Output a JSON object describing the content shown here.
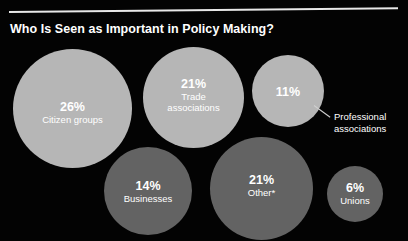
{
  "chart_data": {
    "type": "bubble",
    "title": "Who Is Seen as Important in Policy Making?",
    "xlabel": "",
    "ylabel": "",
    "units": "percent",
    "grid": false,
    "legend": "none",
    "colors": {
      "background": "#030303",
      "bubble_light": "#b6b6b6",
      "bubble_dark": "#636363",
      "text": "#ffffff",
      "rule": "#e8e8e8",
      "callout_line": "#cfcfcf"
    },
    "categories": [
      "Citizen groups",
      "Trade associations",
      "Professional associations",
      "Businesses",
      "Other*",
      "Unions"
    ],
    "values": [
      26,
      21,
      11,
      14,
      21,
      6
    ],
    "points": [
      {
        "label": "Citizen groups",
        "value": 26,
        "value_text": "26%",
        "label_inside": true,
        "fill": "light"
      },
      {
        "label": "Trade associations",
        "value": 21,
        "value_text": "21%",
        "label_inside": true,
        "fill": "light"
      },
      {
        "label": "Professional associations",
        "value": 11,
        "value_text": "11%",
        "label_inside": false,
        "fill": "light"
      },
      {
        "label": "Businesses",
        "value": 14,
        "value_text": "14%",
        "label_inside": true,
        "fill": "dark"
      },
      {
        "label": "Other*",
        "value": 21,
        "value_text": "21%",
        "label_inside": true,
        "fill": "dark"
      },
      {
        "label": "Unions",
        "value": 6,
        "value_text": "6%",
        "label_inside": true,
        "fill": "dark"
      }
    ],
    "annotations": [
      {
        "text": "Professional\nassociations",
        "attached_to": "Professional associations",
        "kind": "leader-line-callout"
      }
    ]
  },
  "bubbles": {
    "citizen_groups": {
      "pct": "26%",
      "label": "Citizen groups"
    },
    "trade_associations": {
      "pct": "21%",
      "label": "Trade\nassociations"
    },
    "professional_associations": {
      "pct": "11%",
      "label": ""
    },
    "businesses": {
      "pct": "14%",
      "label": "Businesses"
    },
    "other": {
      "pct": "21%",
      "label": "Other*"
    },
    "unions": {
      "pct": "6%",
      "label": "Unions"
    }
  },
  "callout": {
    "label": "Professional\nassociations"
  }
}
